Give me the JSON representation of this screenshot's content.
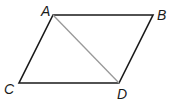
{
  "diagram": {
    "type": "parallelogram",
    "vertices": [
      {
        "label": "A",
        "x": 53,
        "y": 15,
        "lx": 41,
        "ly": 16
      },
      {
        "label": "B",
        "x": 153,
        "y": 15,
        "lx": 157,
        "ly": 20
      },
      {
        "label": "C",
        "x": 19,
        "y": 83,
        "lx": 4,
        "ly": 94
      },
      {
        "label": "D",
        "x": 119,
        "y": 83,
        "lx": 117,
        "ly": 99
      }
    ],
    "edges": [
      [
        "A",
        "B"
      ],
      [
        "B",
        "D"
      ],
      [
        "D",
        "C"
      ],
      [
        "C",
        "A"
      ]
    ],
    "diagonal": {
      "from": "A",
      "to": "D",
      "color": "#999999"
    },
    "stroke_color": "#1a1a1a"
  }
}
